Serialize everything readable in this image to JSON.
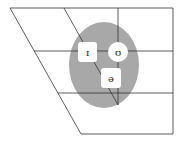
{
  "diagram": {
    "type": "vowel-chart",
    "colors": {
      "lines": "#333333",
      "ellipse": "#a8a8a8",
      "box_fill": "#ffffff",
      "symbol": "#222222"
    },
    "symbols": [
      {
        "id": "near-close-front",
        "glyph": "ɪ",
        "shape": "rounded-box"
      },
      {
        "id": "near-close-back",
        "glyph": "ʊ",
        "shape": "circle"
      },
      {
        "id": "mid-central",
        "glyph": "ə",
        "shape": "rounded-box"
      }
    ]
  }
}
